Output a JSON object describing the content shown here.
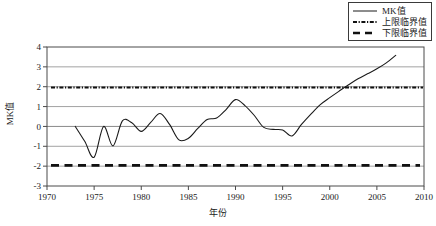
{
  "chart_data": {
    "type": "line",
    "title": "",
    "xlabel": "年份",
    "ylabel": "MK值",
    "xlim": [
      1970,
      2010
    ],
    "ylim": [
      -3,
      4
    ],
    "xticks": [
      1970,
      1975,
      1980,
      1985,
      1990,
      1995,
      2000,
      2005,
      2010
    ],
    "yticks": [
      -3,
      -2,
      -1,
      0,
      1,
      2,
      3,
      4
    ],
    "grid": "horizontal",
    "legend_position": "top-right",
    "series": [
      {
        "name": "MK值",
        "style": "solid",
        "color": "#1a1a1a",
        "x": [
          1973,
          1974,
          1975,
          1976,
          1977,
          1978,
          1979,
          1980,
          1981,
          1982,
          1983,
          1984,
          1985,
          1986,
          1987,
          1988,
          1989,
          1990,
          1991,
          1992,
          1993,
          1994,
          1995,
          1996,
          1997,
          1998,
          1999,
          2000,
          2001,
          2002,
          2003,
          2004,
          2005,
          2006,
          2007
        ],
        "values": [
          0.0,
          -0.75,
          -1.55,
          0.0,
          -0.98,
          0.28,
          0.18,
          -0.25,
          0.2,
          0.65,
          0.1,
          -0.68,
          -0.6,
          -0.1,
          0.35,
          0.42,
          0.85,
          1.35,
          1.05,
          0.55,
          -0.05,
          -0.15,
          -0.18,
          -0.48,
          0.1,
          0.62,
          1.1,
          1.45,
          1.78,
          2.1,
          2.4,
          2.65,
          2.9,
          3.2,
          3.58
        ]
      },
      {
        "name": "上限临界值",
        "style": "dash-dot",
        "color": "#111111",
        "constant": 1.96
      },
      {
        "name": "下限临界值",
        "style": "dashed",
        "color": "#111111",
        "constant": -1.96
      }
    ]
  },
  "legend": {
    "items": [
      {
        "label": "MK值",
        "style": "solid"
      },
      {
        "label": "上限临界值",
        "style": "dash-dot"
      },
      {
        "label": "下限临界值",
        "style": "dashed"
      }
    ]
  },
  "axes": {
    "x_title": "年份",
    "y_title": "MK值",
    "x_tick_labels": [
      "1970",
      "1975",
      "1980",
      "1985",
      "1990",
      "1995",
      "2000",
      "2005",
      "2010"
    ],
    "y_tick_labels": [
      "4",
      "3",
      "2",
      "1",
      "0",
      "-1",
      "-2",
      "-3"
    ]
  },
  "colors": {
    "line": "#1a1a1a",
    "grid": "#8a8a8a",
    "frame": "#4a4a4a",
    "background": "#ffffff"
  }
}
